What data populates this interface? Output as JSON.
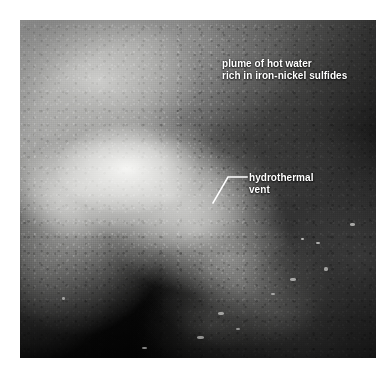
{
  "figure": {
    "type": "photograph",
    "background_color": "#ffffff",
    "photo": {
      "left": 20,
      "top": 20,
      "width": 356,
      "height": 338,
      "palette": {
        "deep_black": "#000000",
        "dark_rock": "#2c2c2c",
        "mid_gray": "#6e6e6e",
        "plume_gray": "#b9b9b7",
        "chimney_white": "#f8f8f6"
      }
    },
    "annotations": [
      {
        "name": "plume-label",
        "lines": [
          "plume of hot water",
          "rich in iron-nickel sulfides"
        ],
        "color": "#ffffff",
        "has_leader_line": false,
        "x": 202,
        "y": 38
      },
      {
        "name": "vent-label",
        "lines": [
          "hydrothermal",
          "vent"
        ],
        "color": "#ffffff",
        "has_leader_line": true,
        "x": 229,
        "y": 152,
        "leader_line": {
          "color": "#ffffff",
          "points": "247,177 228,177 213,203"
        }
      }
    ]
  }
}
